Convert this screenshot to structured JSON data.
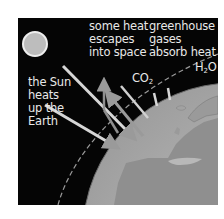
{
  "diagram": {
    "labels": {
      "escape": "some heat\nescapes\ninto space",
      "greenhouse": "greenhouse\ngases\nabsorb heat",
      "sun": "the Sun\nheats\nup the\nEarth",
      "co2_main": "CO",
      "co2_sub": "2",
      "h2o_h": "H",
      "h2o_sub": "2",
      "h2o_o": "O"
    },
    "elements": [
      "sun",
      "incoming sunlight arrows",
      "reflected heat arrows",
      "atmosphere boundary (dashed)",
      "Earth globe showing Europe",
      "absorbed heat bars"
    ],
    "colors": {
      "background": "#050505",
      "text": "#e8e8e8",
      "sun": "#bdbdbd",
      "arrow": "#c8c8c8",
      "earth_ocean": "#b8b8b8",
      "earth_land": "#8f8f8f",
      "page": "#ffffff"
    }
  }
}
